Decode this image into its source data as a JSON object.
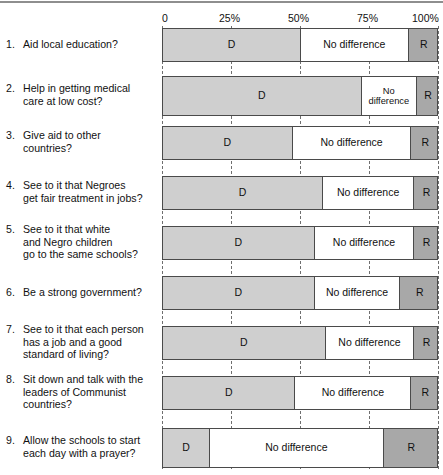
{
  "chart_data": {
    "type": "bar",
    "subtype": "stacked-horizontal-100%",
    "title": "",
    "xlabel": "",
    "ylabel": "",
    "xlim": [
      0,
      100
    ],
    "grid": true,
    "grid_axis": "x",
    "grid_style": "dashed",
    "legend_position": "in-bar",
    "axis_ticks": [
      {
        "value": 0,
        "label": "0"
      },
      {
        "value": 25,
        "label": "25%"
      },
      {
        "value": 50,
        "label": "50%"
      },
      {
        "value": 75,
        "label": "75%"
      },
      {
        "value": 100,
        "label": "100%"
      }
    ],
    "series": [
      {
        "name": "D",
        "label": "D",
        "color": "#cfcfcf"
      },
      {
        "name": "No difference",
        "label": "No difference",
        "color": "#ffffff"
      },
      {
        "name": "R",
        "label": "R",
        "color": "#a8a8a8"
      }
    ],
    "categories": [
      "Aid local education?",
      "Help in getting medical care at low cost?",
      "Give aid to other countries?",
      "See to it that Negroes get fair treatment in jobs?",
      "See to it that white and Negro children go to the same schools?",
      "Be a strong government?",
      "See to it that each person has a job and a good standard of living?",
      "Sit down and talk with the leaders of Communist countries?",
      "Allow the schools to start each day with a prayer?"
    ],
    "rows": [
      {
        "number": "1.",
        "lines": [
          "Aid local education?"
        ],
        "d": 50,
        "no_difference": 39,
        "r": 11,
        "labels": {
          "d": "D",
          "nd": "No difference",
          "r": "R"
        },
        "nd_two_line": false
      },
      {
        "number": "2.",
        "lines": [
          "Help in getting medical",
          "care at low cost?"
        ],
        "d": 72,
        "no_difference": 20,
        "r": 8,
        "labels": {
          "d": "D",
          "nd": "No difference",
          "r": "R"
        },
        "nd_two_line": true
      },
      {
        "number": "3.",
        "lines": [
          "Give aid to other",
          "countries?"
        ],
        "d": 47,
        "no_difference": 43,
        "r": 10,
        "labels": {
          "d": "D",
          "nd": "No difference",
          "r": "R"
        },
        "nd_two_line": false
      },
      {
        "number": "4.",
        "lines": [
          "See to it that Negroes",
          "get fair treatment in jobs?"
        ],
        "d": 58,
        "no_difference": 33,
        "r": 9,
        "labels": {
          "d": "D",
          "nd": "No difference",
          "r": "R"
        },
        "nd_two_line": false
      },
      {
        "number": "5.",
        "lines": [
          "See to it that white",
          "and Negro  children",
          "go to the same schools?"
        ],
        "d": 55,
        "no_difference": 36,
        "r": 9,
        "labels": {
          "d": "D",
          "nd": "No difference",
          "r": "R"
        },
        "nd_two_line": false
      },
      {
        "number": "6.",
        "lines": [
          "Be a strong government?"
        ],
        "d": 55,
        "no_difference": 31,
        "r": 14,
        "labels": {
          "d": "D",
          "nd": "No difference",
          "r": "R"
        },
        "nd_two_line": false
      },
      {
        "number": "7.",
        "lines": [
          "See to it that each person",
          "has a job and a good",
          "standard of living?"
        ],
        "d": 59,
        "no_difference": 32,
        "r": 9,
        "labels": {
          "d": "D",
          "nd": "No difference",
          "r": "R"
        },
        "nd_two_line": false
      },
      {
        "number": "8.",
        "lines": [
          "Sit down and talk with the",
          "leaders of Communist",
          "countries?"
        ],
        "d": 48,
        "no_difference": 42,
        "r": 10,
        "labels": {
          "d": "D",
          "nd": "No difference",
          "r": "R"
        },
        "nd_two_line": false
      },
      {
        "number": "9.",
        "lines": [
          "Allow the schools to start",
          "each day with a prayer?"
        ],
        "d": 17,
        "no_difference": 63,
        "r": 20,
        "labels": {
          "d": "D",
          "nd": "No difference",
          "r": "R"
        },
        "nd_two_line": false
      }
    ]
  },
  "colors": {
    "d": "#cfcfcf",
    "no_difference": "#ffffff",
    "r": "#a8a8a8",
    "border": "#4a4a4a",
    "grid": "#6f6f6f",
    "text": "#111111"
  }
}
